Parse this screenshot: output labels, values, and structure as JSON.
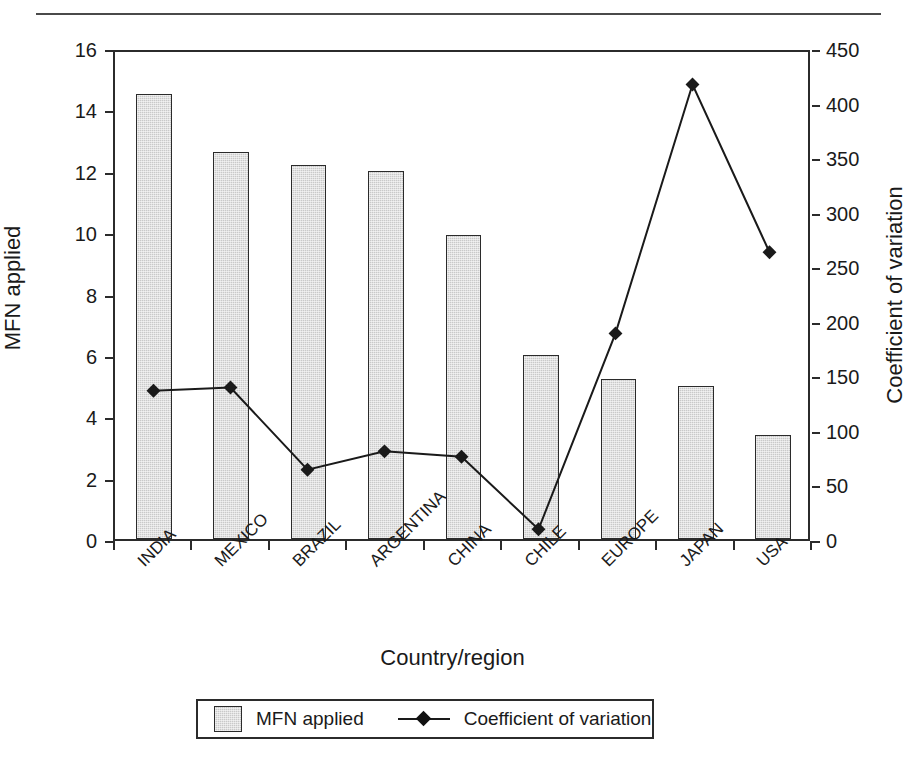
{
  "chart_data": {
    "type": "bar",
    "title": "",
    "xlabel": "Country/region",
    "ylabel": "MFN applied",
    "y2label": "Coefficient of variation",
    "categories": [
      "INDIA",
      "MEXICO",
      "BRAZIL",
      "ARGENTINA",
      "CHINA",
      "CHILE",
      "EUROPE",
      "JAPAN",
      "USA"
    ],
    "ylim": [
      0,
      16
    ],
    "y2lim": [
      0,
      450
    ],
    "yticks": [
      0,
      2,
      4,
      6,
      8,
      10,
      12,
      14,
      16
    ],
    "y2ticks": [
      0,
      50,
      100,
      150,
      200,
      250,
      300,
      350,
      400,
      450
    ],
    "grid": false,
    "legend_position": "bottom-center",
    "series": [
      {
        "name": "MFN applied",
        "kind": "bar",
        "axis": "left",
        "color": "#c9c9c9",
        "values": [
          14.5,
          12.6,
          12.2,
          12.0,
          9.9,
          6.0,
          5.2,
          5.0,
          3.4
        ]
      },
      {
        "name": "Coefficient of variation",
        "kind": "line",
        "axis": "right",
        "color": "#1a1a1a",
        "marker": "diamond",
        "values": [
          137,
          140,
          64,
          81,
          76,
          9,
          190,
          420,
          265
        ]
      }
    ]
  },
  "axes": {
    "left": {
      "title": "MFN applied",
      "tick_labels": [
        "0",
        "2",
        "4",
        "6",
        "8",
        "10",
        "12",
        "14",
        "16"
      ]
    },
    "right": {
      "title": "Coefficient of variation",
      "tick_labels": [
        "0",
        "50",
        "100",
        "150",
        "200",
        "250",
        "300",
        "350",
        "400",
        "450"
      ]
    },
    "bottom": {
      "title": "Country/region",
      "tick_labels": [
        "INDIA",
        "MEXICO",
        "BRAZIL",
        "ARGENTINA",
        "CHINA",
        "CHILE",
        "EUROPE",
        "JAPAN",
        "USA"
      ]
    }
  },
  "legend": {
    "items": [
      {
        "label": "MFN applied",
        "marker": "swatch",
        "color": "#c9c9c9"
      },
      {
        "label": "Coefficient of variation",
        "marker": "line-diamond",
        "color": "#1a1a1a"
      }
    ]
  },
  "colors": {
    "bar_fill": "#c9c9c9",
    "bar_stroke": "#2b2b2b",
    "line": "#1a1a1a",
    "axis": "#2b2b2b",
    "background": "#ffffff"
  }
}
